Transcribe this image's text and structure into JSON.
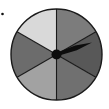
{
  "figure": {
    "type": "spinner",
    "bullet_marker": {
      "x": 2.5,
      "y": 14,
      "r": 1.3,
      "color": "#111111"
    },
    "center": {
      "x": 56.5,
      "y": 54.5
    },
    "radius": 45.5,
    "outline_color": "#1a1a1a",
    "divider_color": "#1a1a1a",
    "sectors": [
      {
        "name": "top-right",
        "start_deg": 0,
        "end_deg": 60,
        "color": "#7c7c7c"
      },
      {
        "name": "right",
        "start_deg": 60,
        "end_deg": 120,
        "color": "#585858"
      },
      {
        "name": "bottom-right",
        "start_deg": 120,
        "end_deg": 180,
        "color": "#707070"
      },
      {
        "name": "bottom-left",
        "start_deg": 180,
        "end_deg": 240,
        "color": "#a2a2a2"
      },
      {
        "name": "left",
        "start_deg": 240,
        "end_deg": 300,
        "color": "#6c6c6c"
      },
      {
        "name": "top-left",
        "start_deg": 300,
        "end_deg": 360,
        "color": "#d9d9d9"
      }
    ],
    "pointer": {
      "tip": {
        "x": 92,
        "y": 42.5
      },
      "hub_radius": 5,
      "color": "#0d0d0d"
    }
  }
}
